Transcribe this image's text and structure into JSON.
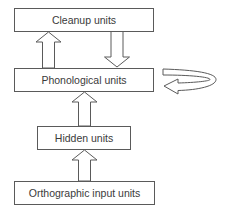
{
  "diagram": {
    "boxes": {
      "cleanup": "Cleanup units",
      "phonological": "Phonological units",
      "hidden": "Hidden units",
      "orthographic": "Orthographic input units"
    },
    "connections": [
      {
        "from": "Phonological units",
        "to": "Cleanup units",
        "type": "block-arrow-up"
      },
      {
        "from": "Cleanup units",
        "to": "Phonological units",
        "type": "block-arrow-down"
      },
      {
        "from": "Phonological units",
        "to": "Phonological units",
        "type": "recurrent-loop"
      },
      {
        "from": "Hidden units",
        "to": "Phonological units",
        "type": "block-arrow-up"
      },
      {
        "from": "Orthographic input units",
        "to": "Hidden units",
        "type": "block-arrow-up"
      }
    ],
    "colors": {
      "stroke": "#5a5a5a",
      "text": "#3a3a3a",
      "background": "#ffffff"
    }
  }
}
